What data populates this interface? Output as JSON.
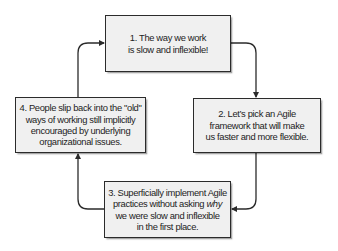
{
  "diagram": {
    "type": "cycle",
    "style": {
      "box_fill": "#f0f0f0",
      "box_border": "#2b2b2b",
      "connector_color": "#2b2b2b",
      "text_color": "#1d1d1d"
    },
    "steps": [
      {
        "id": "step-1",
        "lines": [
          "1. The way we work",
          "is slow and inflexible!"
        ]
      },
      {
        "id": "step-2",
        "lines": [
          "2. Let’s pick an Agile",
          "framework that will make",
          "us faster and more flexible."
        ]
      },
      {
        "id": "step-3",
        "lines": [
          "3. Superficially implement Agile",
          "practices without asking",
          "we were slow and inflexible",
          "in the first place."
        ],
        "line2_emphasis": "why"
      },
      {
        "id": "step-4",
        "lines": [
          "4. People slip back into the \"old\"",
          "ways of working still implicitly",
          "encouraged by underlying",
          "organizational issues."
        ]
      }
    ],
    "edges": [
      {
        "from": "step-1",
        "to": "step-2"
      },
      {
        "from": "step-2",
        "to": "step-3"
      },
      {
        "from": "step-3",
        "to": "step-4"
      },
      {
        "from": "step-4",
        "to": "step-1"
      }
    ]
  }
}
